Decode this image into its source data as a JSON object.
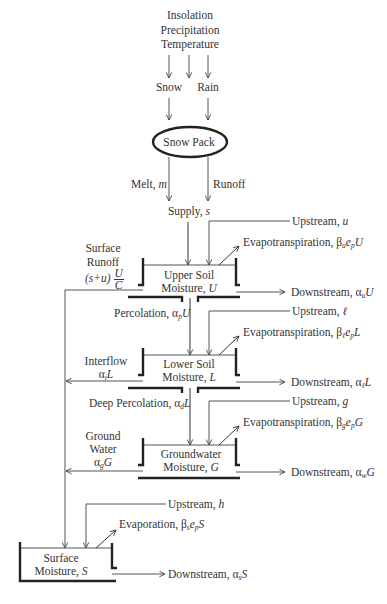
{
  "diagram": {
    "inputs": [
      "Insolation",
      "Precipitation",
      "Temperature"
    ],
    "precip_forms": {
      "snow": "Snow",
      "rain": "Rain"
    },
    "snow_pack": "Snow Pack",
    "melt": {
      "label": "Melt, ",
      "symbol": "m"
    },
    "runoff": "Runoff",
    "supply": {
      "label": "Supply, ",
      "symbol": "s"
    },
    "upper_soil": {
      "line1": "Upper Soil",
      "line2": "Moisture, ",
      "symbol": "U",
      "upstream": {
        "label": "Upstream, ",
        "symbol": "u"
      },
      "evap": {
        "label": "Evapotranspiration, β",
        "sub": "u",
        "mid": "e",
        "sub2": "p",
        "end": "U"
      },
      "downstream": {
        "label": "Downstream, α",
        "sub": "u",
        "end": "U"
      }
    },
    "surface_runoff": {
      "line1": "Surface",
      "line2": "Runoff",
      "expr": "(s+u)",
      "frac_num": "U",
      "frac_den": "C"
    },
    "percolation": {
      "label": "Percolation, α",
      "sub": "p",
      "end": "U"
    },
    "lower_soil": {
      "line1": "Lower Soil",
      "line2": "Moisture, ",
      "symbol": "L",
      "upstream": {
        "label": "Upstream, ",
        "symbol": "ℓ"
      },
      "evap": {
        "label": "Evapotranspiration, β",
        "sub": "ℓ",
        "mid": "e",
        "sub2": "p",
        "end": "L"
      },
      "downstream": {
        "label": "Downstream, α",
        "sub": "ℓ",
        "end": "L"
      }
    },
    "interflow": {
      "line1": "Interflow",
      "label": "α",
      "sub": "i",
      "end": "L"
    },
    "deep_percolation": {
      "label": "Deep Percolation, α",
      "sub": "d",
      "end": "L"
    },
    "groundwater": {
      "line1": "Groundwater",
      "line2": "Moisture, ",
      "symbol": "G",
      "upstream": {
        "label": "Upstream, ",
        "symbol": "g"
      },
      "evap": {
        "label": "Evapotranspiration, β",
        "sub": "g",
        "mid": "e",
        "sub2": "p",
        "end": "G"
      },
      "downstream": {
        "label": "Downstream, α",
        "sub": "w",
        "end": "G"
      }
    },
    "ground_water_flow": {
      "line1": "Ground",
      "line2": "Water",
      "label": "α",
      "sub": "g",
      "end": "G"
    },
    "surface_moisture": {
      "line1": "Surface",
      "line2": "Moisture, ",
      "symbol": "S",
      "upstream": {
        "label": "Upstream, ",
        "symbol": "h"
      },
      "evap": {
        "label": "Evaporation, β",
        "sub": "s",
        "mid": "e",
        "sub2": "p",
        "end": "S"
      },
      "downstream": {
        "label": "Downstream, α",
        "sub": "s",
        "end": "S"
      }
    }
  }
}
